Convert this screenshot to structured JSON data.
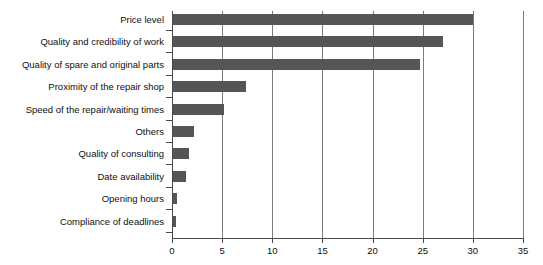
{
  "chart_data": {
    "type": "bar",
    "orientation": "horizontal",
    "title": "",
    "xlabel": "",
    "ylabel": "",
    "categories": [
      "Price level",
      "Quality and credibility of work",
      "Quality of spare and original parts",
      "Proximity of the repair shop",
      "Speed of the repair/waiting times",
      "Others",
      "Quality of consulting",
      "Date availability",
      "Opening hours",
      "Compliance of deadlines"
    ],
    "values": [
      30.0,
      27.0,
      24.7,
      7.4,
      5.2,
      2.2,
      1.7,
      1.4,
      0.5,
      0.4
    ],
    "xlim": [
      0,
      35
    ],
    "xticks": [
      0,
      5,
      10,
      15,
      20,
      25,
      30,
      35
    ],
    "xtick_labels": [
      "0",
      "5",
      "10",
      "15",
      "20",
      "25",
      "30",
      "35"
    ],
    "grid": "vertical",
    "legend": "none",
    "bar_color": "#555555",
    "axis_color": "#4a4a4a",
    "gridline_color": "#7a7a7a",
    "background_color": "#ffffff"
  }
}
